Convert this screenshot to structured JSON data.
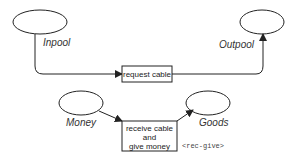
{
  "diagram": {
    "places": [
      {
        "id": "inpool",
        "label": "Inpool"
      },
      {
        "id": "outpool",
        "label": "Outpool"
      },
      {
        "id": "money",
        "label": "Money"
      },
      {
        "id": "goods",
        "label": "Goods"
      }
    ],
    "transitions": [
      {
        "id": "request-cable",
        "lines": [
          "request cable"
        ]
      },
      {
        "id": "receive-cable",
        "lines": [
          "receive cable",
          "and",
          "give money"
        ]
      }
    ],
    "annotation": "<rec-give>",
    "colors": {
      "stroke": "#222222",
      "background": "#ffffff"
    }
  }
}
